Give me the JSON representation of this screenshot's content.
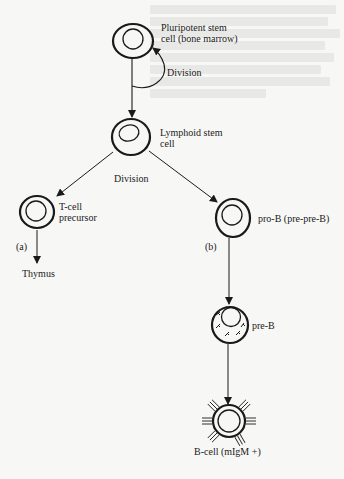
{
  "diagram": {
    "type": "lineage-flowchart",
    "nodes": [
      {
        "id": "pluripotent",
        "label_line1": "Pluripotent stem",
        "label_line2": "cell (bone marrow)"
      },
      {
        "id": "lymphoid",
        "label_line1": "Lymphoid stem",
        "label_line2": "cell"
      },
      {
        "id": "tcell",
        "label_line1": "T-cell",
        "label_line2": "precursor"
      },
      {
        "id": "prob",
        "label": "pro-B (pre-pre-B)"
      },
      {
        "id": "preb",
        "label": "pre-B"
      },
      {
        "id": "bcell",
        "label": "B-cell (mIgM +)"
      },
      {
        "id": "thymus",
        "label": "Thymus"
      }
    ],
    "edge_labels": {
      "self_division": "Division",
      "lymphoid_division": "Division",
      "branch_a": "(a)",
      "branch_b": "(b)"
    },
    "edges": [
      {
        "from": "pluripotent",
        "to": "pluripotent",
        "label": "Division"
      },
      {
        "from": "pluripotent",
        "to": "lymphoid"
      },
      {
        "from": "lymphoid",
        "to": "tcell",
        "label": "Division"
      },
      {
        "from": "lymphoid",
        "to": "prob",
        "label": "Division"
      },
      {
        "from": "tcell",
        "to": "thymus",
        "label": "(a)"
      },
      {
        "from": "prob",
        "to": "preb",
        "label": "(b)"
      },
      {
        "from": "preb",
        "to": "bcell"
      }
    ],
    "colors": {
      "ink": "#1a1a1a",
      "paper": "#f7f7f5"
    }
  }
}
